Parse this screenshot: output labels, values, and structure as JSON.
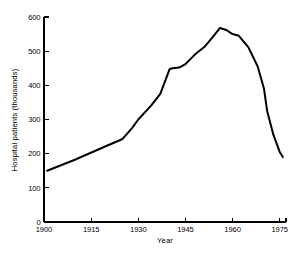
{
  "chart_data": {
    "type": "line",
    "title": "",
    "subtitle": "",
    "xlabel": "Year",
    "ylabel": "Hospital patients (thousands)",
    "xlim": [
      1900,
      1977
    ],
    "ylim": [
      0,
      600
    ],
    "xticks": [
      1900,
      1915,
      1930,
      1945,
      1960,
      1975
    ],
    "xtick_labels": [
      "1900",
      "1915",
      "1930",
      "1945",
      "1960",
      "1975"
    ],
    "yticks": [
      0,
      100,
      200,
      300,
      400,
      500,
      600
    ],
    "ytick_labels": [
      "0",
      "100",
      "200",
      "300",
      "400",
      "500",
      "600"
    ],
    "grid": false,
    "legend": false,
    "legend_position": "none",
    "line_color": "#000000",
    "background_color": "#ffffff",
    "series": [
      {
        "name": "Hospital patients",
        "x": [
          1901,
          1910,
          1918,
          1925,
          1928,
          1930,
          1934,
          1937,
          1940,
          1941,
          1943,
          1945,
          1948,
          1951,
          1954,
          1956,
          1958,
          1960,
          1962,
          1965,
          1968,
          1970,
          1971,
          1973,
          1975,
          1976
        ],
        "values": [
          150,
          183,
          215,
          243,
          275,
          300,
          340,
          375,
          448,
          450,
          452,
          462,
          490,
          512,
          545,
          568,
          562,
          550,
          545,
          512,
          455,
          390,
          325,
          255,
          205,
          190
        ]
      }
    ]
  },
  "axes": {
    "y_axis_title": "Hospital patients (thousands)",
    "x_axis_title": "Year"
  }
}
